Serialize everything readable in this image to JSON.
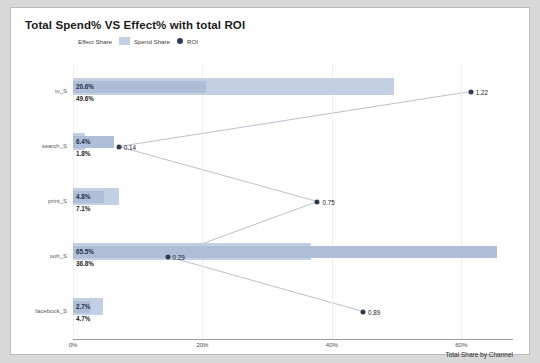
{
  "chart": {
    "title": "Total Spend% VS Effect% with total ROI",
    "xaxis_title": "Total Share by Channel",
    "legend": [
      {
        "label": "Effect Share",
        "marker": "square-swatch-icon"
      },
      {
        "label": "Spend Share",
        "marker": "square-swatch-icon"
      },
      {
        "label": "ROI",
        "marker": "circle-marker-icon"
      }
    ]
  },
  "chart_data": {
    "type": "bar",
    "title": "Total Spend% VS Effect% with total ROI",
    "xlabel": "Total Share by Channel",
    "ylabel": "",
    "xlim": [
      0,
      68
    ],
    "xticks": [
      "0%",
      "20%",
      "40%",
      "60%"
    ],
    "xtick_values": [
      0,
      20,
      40,
      60
    ],
    "grid": true,
    "legend_position": "top-left",
    "orientation": "horizontal",
    "categories": [
      "tv_S",
      "search_S",
      "print_S",
      "ooh_S",
      "facebook_S"
    ],
    "series": [
      {
        "name": "Effect Share",
        "values": [
          20.6,
          6.4,
          4.8,
          65.5,
          2.7
        ],
        "labels": [
          "20.6%",
          "6.4%",
          "4.8%",
          "65.5%",
          "2.7%"
        ],
        "color": "#aebed6"
      },
      {
        "name": "Spend Share",
        "values": [
          49.6,
          1.8,
          7.1,
          36.8,
          4.7
        ],
        "labels": [
          "49.6%",
          "1.8%",
          "7.1%",
          "36.8%",
          "4.7%"
        ],
        "color": "#c3cfe2"
      },
      {
        "name": "ROI",
        "values": [
          1.22,
          0.14,
          0.75,
          0.29,
          0.89
        ],
        "labels": [
          "1.22",
          "0.14",
          "0.75",
          "0.29",
          "0.89"
        ],
        "color": "#2f3a54"
      }
    ]
  }
}
